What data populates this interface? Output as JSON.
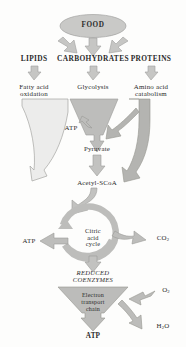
{
  "diagram": {
    "source_node": {
      "label": "FOOD"
    },
    "macronutrients": [
      {
        "label": "LIPIDS"
      },
      {
        "label": "CARBOHYDRATES"
      },
      {
        "label": "PROTEINS"
      }
    ],
    "pathways": [
      {
        "line1": "Fatty acid",
        "line2": "oxidation"
      },
      {
        "line1": "Glycolysis",
        "line2": ""
      },
      {
        "line1": "Amino acid",
        "line2": "catabolism"
      }
    ],
    "intermediates": {
      "pyruvate": "Pyruvate",
      "acetyl_scoa": "Acetyl-SCoA"
    },
    "glycolysis_atp": "ATP",
    "cycle": {
      "line1": "Citric",
      "line2": "acid",
      "line3": "cycle",
      "atp_output": "ATP",
      "co2_output": "CO",
      "co2_sub": "2"
    },
    "reduced_coenzymes": {
      "line1": "REDUCED",
      "line2": "COENZYMES"
    },
    "electron_transport": {
      "line1": "Electron",
      "line2": "transport",
      "line3": "chain"
    },
    "oxygen_input": {
      "symbol": "O",
      "sub": "2"
    },
    "water_output": {
      "symbol": "H",
      "sub": "2",
      "tail": "O"
    },
    "final_atp": "ATP",
    "colors": {
      "pale_funnel": "#e8e8e6",
      "mid_gray": "#b9b9b7",
      "dark_gray": "#a9a9a6",
      "outline": "#8d8d8a",
      "text": "#2b2b2b",
      "background": "#fdfdfc"
    }
  }
}
